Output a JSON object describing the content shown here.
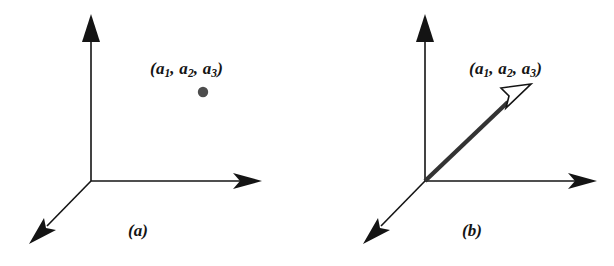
{
  "figure": {
    "background_color": "#ffffff",
    "ink_color": "#141414",
    "point_color": "#4d4d4d",
    "vector_color": "#333333",
    "arrowhead_fill_open": "#ffffff",
    "panels": [
      {
        "id": "a",
        "caption": "(a)",
        "label_open_paren": "(",
        "label_close_paren": ")",
        "label_plain": "(a1, a2, a3)",
        "components": [
          {
            "base": "a",
            "sub": "1"
          },
          {
            "base": "a",
            "sub": "2"
          },
          {
            "base": "a",
            "sub": "3"
          }
        ],
        "separator": ", ",
        "depicts": "point",
        "axes": [
          {
            "name": "z-axis",
            "direction": "up",
            "arrowhead": "solid"
          },
          {
            "name": "y-axis",
            "direction": "right",
            "arrowhead": "solid"
          },
          {
            "name": "x-axis",
            "direction": "down-left",
            "arrowhead": "solid"
          }
        ]
      },
      {
        "id": "b",
        "caption": "(b)",
        "label_open_paren": "(",
        "label_close_paren": ")",
        "label_plain": "(a1, a2, a3)",
        "components": [
          {
            "base": "a",
            "sub": "1"
          },
          {
            "base": "a",
            "sub": "2"
          },
          {
            "base": "a",
            "sub": "3"
          }
        ],
        "separator": ", ",
        "depicts": "vector",
        "axes": [
          {
            "name": "z-axis",
            "direction": "up",
            "arrowhead": "solid"
          },
          {
            "name": "y-axis",
            "direction": "right",
            "arrowhead": "solid"
          },
          {
            "name": "x-axis",
            "direction": "down-left",
            "arrowhead": "solid"
          }
        ]
      }
    ]
  }
}
